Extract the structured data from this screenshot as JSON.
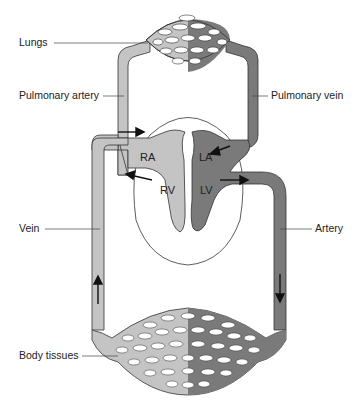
{
  "labels": {
    "lungs": "Lungs",
    "pulmonary_artery": "Pulmonary artery",
    "pulmonary_vein": "Pulmonary vein",
    "vein": "Vein",
    "artery": "Artery",
    "body_tissues": "Body tissues"
  },
  "chambers": {
    "ra": "RA",
    "la": "LA",
    "rv": "RV",
    "lv": "LV"
  },
  "colors": {
    "deoxygenated": "#c4c4c4",
    "oxygenated": "#7a7a7a",
    "outline": "#333333",
    "background": "#ffffff"
  }
}
